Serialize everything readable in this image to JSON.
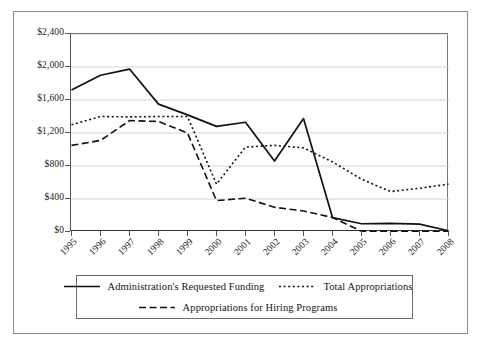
{
  "chart_data": {
    "type": "line",
    "title": "",
    "xlabel": "",
    "ylabel": "",
    "grid": true,
    "legend_position": "bottom",
    "ylim": [
      0,
      2400
    ],
    "ytick_values": [
      0,
      400,
      800,
      1200,
      1600,
      2000,
      2400
    ],
    "ytick_labels": [
      "$0",
      "$400",
      "$800",
      "$1,200",
      "$1,600",
      "$2,000",
      "$2,400"
    ],
    "categories": [
      "1995",
      "1996",
      "1997",
      "1998",
      "1999",
      "2000",
      "2001",
      "2002",
      "2003",
      "2004",
      "2005",
      "2006",
      "2007",
      "2008"
    ],
    "series": [
      {
        "name": "Administration's Requested Funding",
        "style": "solid",
        "color": "#111111",
        "values": [
          1720,
          1900,
          1975,
          1550,
          1420,
          1280,
          1330,
          860,
          1375,
          175,
          100,
          105,
          95,
          15
        ]
      },
      {
        "name": "Total Appropriations",
        "style": "dotted",
        "color": "#111111",
        "values": [
          1300,
          1400,
          1395,
          1400,
          1400,
          580,
          1030,
          1050,
          1020,
          850,
          640,
          490,
          530,
          580
        ]
      },
      {
        "name": "Appropriations for Hiring Programs",
        "style": "dashed",
        "color": "#111111",
        "values": [
          1050,
          1110,
          1350,
          1340,
          1200,
          380,
          410,
          300,
          255,
          175,
          10,
          8,
          8,
          8
        ]
      }
    ]
  },
  "legend": {
    "entries": [
      {
        "label": "Administration's Requested Funding",
        "style": "solid"
      },
      {
        "label": "Total Appropriations",
        "style": "dotted"
      },
      {
        "label": "Appropriations for Hiring Programs",
        "style": "dashed"
      }
    ]
  }
}
